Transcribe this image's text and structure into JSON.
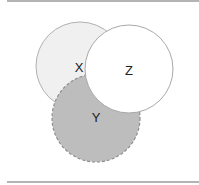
{
  "diagram": {
    "type": "venn",
    "sets": [
      {
        "id": "X",
        "label": "X",
        "cx": 80,
        "cy": 66,
        "r": 44,
        "fill": "#f0f0f0",
        "stroke": "#b0b0b0",
        "dashed": false
      },
      {
        "id": "Y",
        "label": "Y",
        "cx": 96,
        "cy": 118,
        "r": 44,
        "fill": "#bdbdbd",
        "stroke": "#8e8e8e",
        "dashed": true
      },
      {
        "id": "Z",
        "label": "Z",
        "cx": 129,
        "cy": 69,
        "r": 44,
        "fill": "#ffffff",
        "stroke": "#a8a8a8",
        "dashed": false
      }
    ],
    "labels": {
      "x": "X",
      "y": "Y",
      "z": "Z"
    }
  }
}
